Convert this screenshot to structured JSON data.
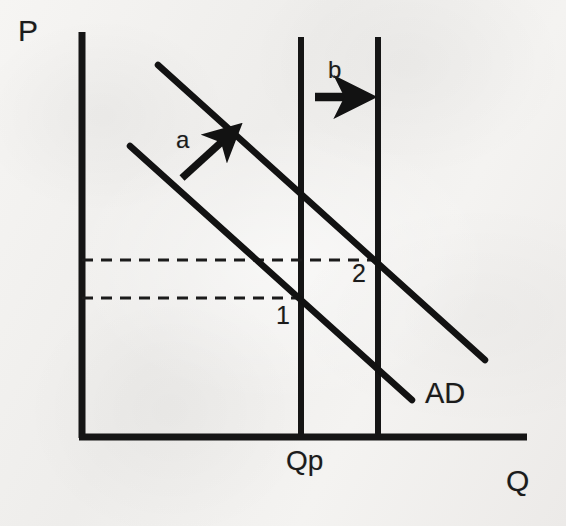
{
  "figure": {
    "background_color": "#f2f1ef",
    "ink_color": "#1b1b1b"
  },
  "axes": {
    "y_label": "P",
    "x_label": "Q",
    "y_axis": {
      "x": 82,
      "y_top": 32,
      "y_bottom": 437
    },
    "x_axis": {
      "y": 437,
      "x_left": 82,
      "x_right": 527
    }
  },
  "tick_labels": [
    {
      "name": "potential-output",
      "text": "Qp",
      "x": 286,
      "y": 447
    }
  ],
  "vertical_lines": [
    {
      "name": "potential-output-line",
      "label": "Qp",
      "x": 301,
      "y_top": 37,
      "y_bottom": 437
    },
    {
      "name": "second-vertical-line",
      "label": "",
      "x": 378,
      "y_top": 37,
      "y_bottom": 437
    }
  ],
  "curves": [
    {
      "name": "ad-initial",
      "label": "AD",
      "x1": 130,
      "y1": 146,
      "x2": 412,
      "y2": 400
    },
    {
      "name": "ad-shifted",
      "label": "",
      "x1": 158,
      "y1": 65,
      "x2": 485,
      "y2": 360
    }
  ],
  "curve_label": {
    "text": "AD",
    "x": 425,
    "y": 379
  },
  "dashed_lines": [
    {
      "name": "price-level-2",
      "y": 260,
      "x_start": 82,
      "x_end": 378
    },
    {
      "name": "price-level-1",
      "y": 298,
      "x_start": 82,
      "x_end": 301
    }
  ],
  "equilibrium_points": [
    {
      "name": "equilibrium-1",
      "text": "1",
      "x": 276,
      "y": 303
    },
    {
      "name": "equilibrium-2",
      "text": "2",
      "x": 352,
      "y": 261
    }
  ],
  "shift_arrows": [
    {
      "name": "arrow-a",
      "label": "a",
      "label_x": 176,
      "label_y": 128,
      "x1": 182,
      "y1": 178,
      "x2": 234,
      "y2": 130,
      "direction": "up-right"
    },
    {
      "name": "arrow-b",
      "label": "b",
      "label_x": 328,
      "label_y": 58,
      "x1": 315,
      "y1": 97,
      "x2": 362,
      "y2": 97,
      "direction": "right"
    }
  ],
  "chart_data": {
    "type": "line",
    "xlabel": "Q",
    "ylabel": "P",
    "grid": false,
    "legend": "none",
    "annotations": [
      "P",
      "Q",
      "Qp",
      "AD",
      "1",
      "2",
      "a",
      "b"
    ],
    "series": [
      {
        "name": "AD",
        "note": "initial aggregate demand curve, downward sloping",
        "points": [
          [
            130,
            146
          ],
          [
            412,
            400
          ]
        ]
      },
      {
        "name": "AD shifted",
        "note": "aggregate demand after rightward shift, parallel to AD",
        "points": [
          [
            158,
            65
          ],
          [
            485,
            360
          ]
        ]
      }
    ],
    "reference_lines": [
      {
        "name": "Qp",
        "type": "vertical",
        "x": 301,
        "note": "potential output"
      },
      {
        "name": "second vertical",
        "type": "vertical",
        "x": 378,
        "note": "output beyond potential"
      },
      {
        "name": "price level 1",
        "type": "horizontal-dashed",
        "y": 298
      },
      {
        "name": "price level 2",
        "type": "horizontal-dashed",
        "y": 260
      }
    ],
    "markers": [
      {
        "label": "1",
        "x": 301,
        "y": 298,
        "note": "initial equilibrium at potential output"
      },
      {
        "label": "2",
        "x": 378,
        "y": 260,
        "note": "new equilibrium at higher price and output"
      }
    ],
    "arrows": [
      {
        "label": "a",
        "note": "rightward/upward shift of AD curve"
      },
      {
        "label": "b",
        "note": "increase in output beyond potential"
      }
    ]
  }
}
